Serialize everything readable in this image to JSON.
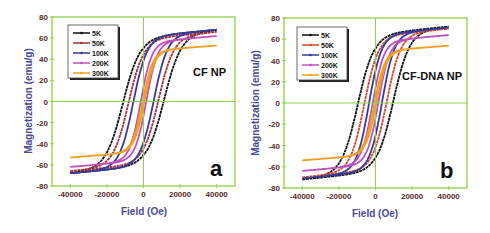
{
  "chart_data": [
    {
      "id": "a",
      "type": "line",
      "title": "",
      "annotation": "CF NP",
      "panel_label": "a",
      "xlabel": "Field (Oe)",
      "ylabel": "Magnetization (emu/g)",
      "xlim": [
        -50000,
        50000
      ],
      "ylim": [
        -80,
        80
      ],
      "xticks": [
        -40000,
        -20000,
        0,
        20000,
        40000
      ],
      "xtick_labels": [
        "-40000",
        "-20000",
        "0",
        "20000",
        "40000"
      ],
      "yticks": [
        -80,
        -60,
        -40,
        -20,
        0,
        20,
        40,
        60,
        80
      ],
      "ytick_labels": [
        "-80",
        "-60",
        "-40",
        "-20",
        "0",
        "20",
        "40",
        "60",
        "80"
      ],
      "grid": "zero lines only",
      "legend_position": "upper left",
      "series": [
        {
          "name": "5K",
          "color": "#111111",
          "Ms": 68,
          "Hc": 11000,
          "x_range": [
            -40000,
            40000
          ]
        },
        {
          "name": "50K",
          "color": "#a0303a",
          "Ms": 66,
          "Hc": 8000,
          "x_range": [
            -40000,
            40000
          ]
        },
        {
          "name": "100K",
          "color": "#3a3a9a",
          "Ms": 68,
          "Hc": 5500,
          "x_range": [
            -40000,
            40000
          ]
        },
        {
          "name": "200K",
          "color": "#c050c0",
          "Ms": 62,
          "Hc": 1500,
          "x_range": [
            -40000,
            40000
          ]
        },
        {
          "name": "300K",
          "color": "#f0a020",
          "Ms": 53,
          "Hc": 500,
          "x_range": [
            -40000,
            40000
          ]
        }
      ]
    },
    {
      "id": "b",
      "type": "line",
      "title": "",
      "annotation": "CF-DNA NP",
      "panel_label": "b",
      "xlabel": "Field (Oe)",
      "ylabel": "Magnetization (emu/g)",
      "xlim": [
        -50000,
        50000
      ],
      "ylim": [
        -80,
        80
      ],
      "xticks": [
        -40000,
        -20000,
        0,
        20000,
        40000
      ],
      "xtick_labels": [
        "-40000",
        "-20000",
        "0",
        "20000",
        "40000"
      ],
      "yticks": [
        -80,
        -60,
        -40,
        -20,
        0,
        20,
        40,
        60,
        80
      ],
      "ytick_labels": [
        "-80",
        "-60",
        "-40",
        "-20",
        "0",
        "20",
        "40",
        "60",
        "80"
      ],
      "grid": "zero lines only",
      "legend_position": "upper left",
      "series": [
        {
          "name": "5K",
          "color": "#111111",
          "Ms": 72,
          "Hc": 9500,
          "x_range": [
            -40000,
            40000
          ]
        },
        {
          "name": "50K",
          "color": "#d04a2a",
          "Ms": 70,
          "Hc": 6000,
          "x_range": [
            -40000,
            40000
          ]
        },
        {
          "name": "100K",
          "color": "#3a3a9a",
          "Ms": 71,
          "Hc": 3500,
          "x_range": [
            -40000,
            40000
          ]
        },
        {
          "name": "200K",
          "color": "#c050c0",
          "Ms": 64,
          "Hc": 1500,
          "x_range": [
            -40000,
            40000
          ]
        },
        {
          "name": "300K",
          "color": "#f0a020",
          "Ms": 54,
          "Hc": 500,
          "x_range": [
            -40000,
            40000
          ]
        }
      ]
    }
  ],
  "style": {
    "frame_color": "#8fd14f",
    "tick_label_color": "#5a2a2a",
    "axis_label_color": "#4a4a9a"
  }
}
